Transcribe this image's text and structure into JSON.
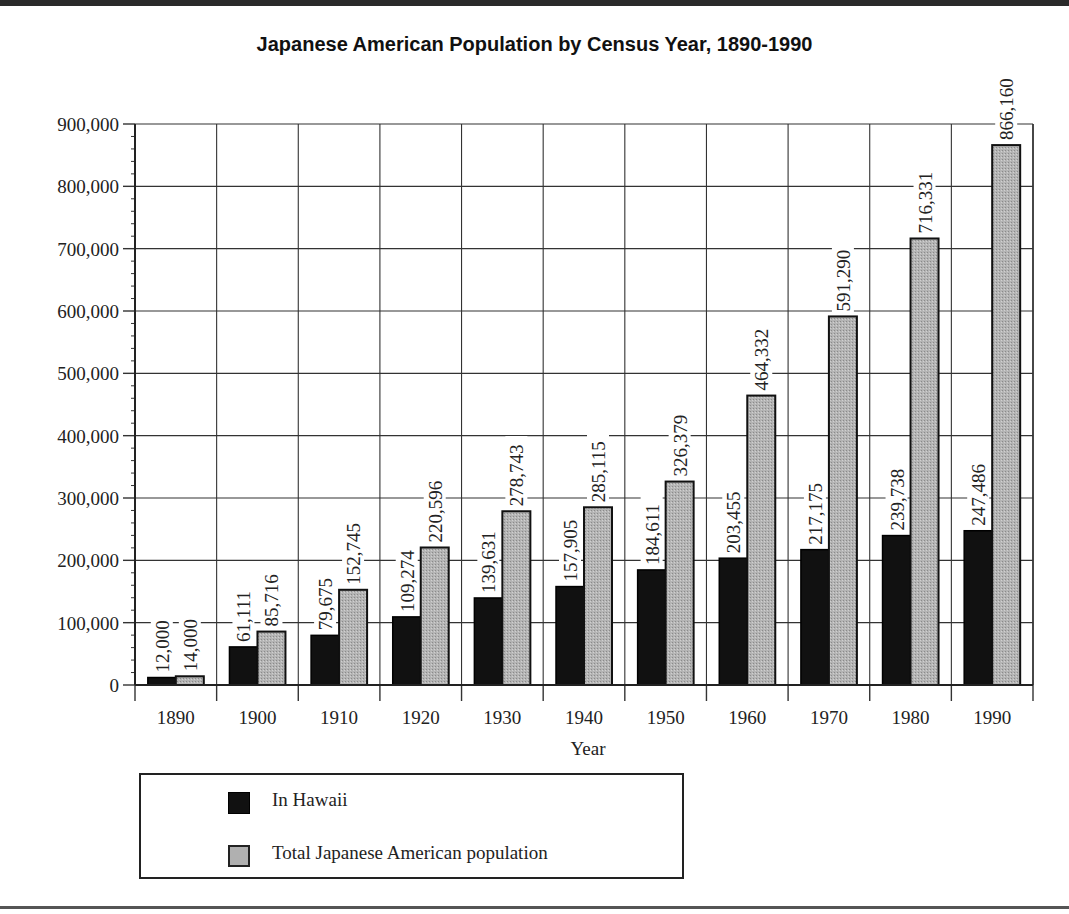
{
  "chart_data": {
    "type": "bar",
    "title": "Japanese American Population by Census Year, 1890-1990",
    "xlabel": "Year",
    "ylabel": "",
    "ylim": [
      0,
      900000
    ],
    "yticks": [
      "0",
      "100,000",
      "200,000",
      "300,000",
      "400,000",
      "500,000",
      "600,000",
      "700,000",
      "800,000",
      "900,000"
    ],
    "grid": true,
    "legend_position": "bottom-left",
    "categories": [
      "1890",
      "1900",
      "1910",
      "1920",
      "1930",
      "1940",
      "1950",
      "1960",
      "1970",
      "1980",
      "1990"
    ],
    "series": [
      {
        "name": "In Hawaii",
        "color": "#111111",
        "values": [
          12000,
          61111,
          79675,
          109274,
          139631,
          157905,
          184611,
          203455,
          217175,
          239738,
          247486
        ],
        "labels": [
          "12,000",
          "61,111",
          "79,675",
          "109,274",
          "139,631",
          "157,905",
          "184,611",
          "203,455",
          "217,175",
          "239,738",
          "247,486"
        ]
      },
      {
        "name": "Total Japanese American population",
        "color": "#a8a8a8",
        "values": [
          14000,
          85716,
          152745,
          220596,
          278743,
          285115,
          326379,
          464332,
          591290,
          716331,
          866160
        ],
        "labels": [
          "14,000",
          "85,716",
          "152,745",
          "220,596",
          "278,743",
          "285,115",
          "326,379",
          "464,332",
          "591,290",
          "716,331",
          "866,160"
        ]
      }
    ]
  },
  "legend": {
    "items": [
      {
        "label": "In Hawaii"
      },
      {
        "label": "Total Japanese American population"
      }
    ]
  }
}
